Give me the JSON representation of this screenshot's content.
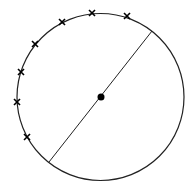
{
  "diagram": {
    "background": "#ffffff",
    "stroke_color": "#222222",
    "circle": {
      "cx": 100.5,
      "cy": 97,
      "r": 83.5,
      "stroke_width": 1.2
    },
    "center_point": {
      "cx": 101,
      "cy": 97,
      "r": 3.5,
      "fill": "#000000"
    },
    "diameter": {
      "x1": 152,
      "y1": 31,
      "x2": 49,
      "y2": 162,
      "stroke_width": 1
    },
    "cross_marks": [
      {
        "x": 62,
        "y": 22
      },
      {
        "x": 92,
        "y": 13
      },
      {
        "x": 127,
        "y": 16
      },
      {
        "x": 35,
        "y": 44
      },
      {
        "x": 21,
        "y": 72
      },
      {
        "x": 17,
        "y": 102
      },
      {
        "x": 27,
        "y": 137
      }
    ],
    "cross_size": 3,
    "cross_stroke_width": 1.6
  }
}
